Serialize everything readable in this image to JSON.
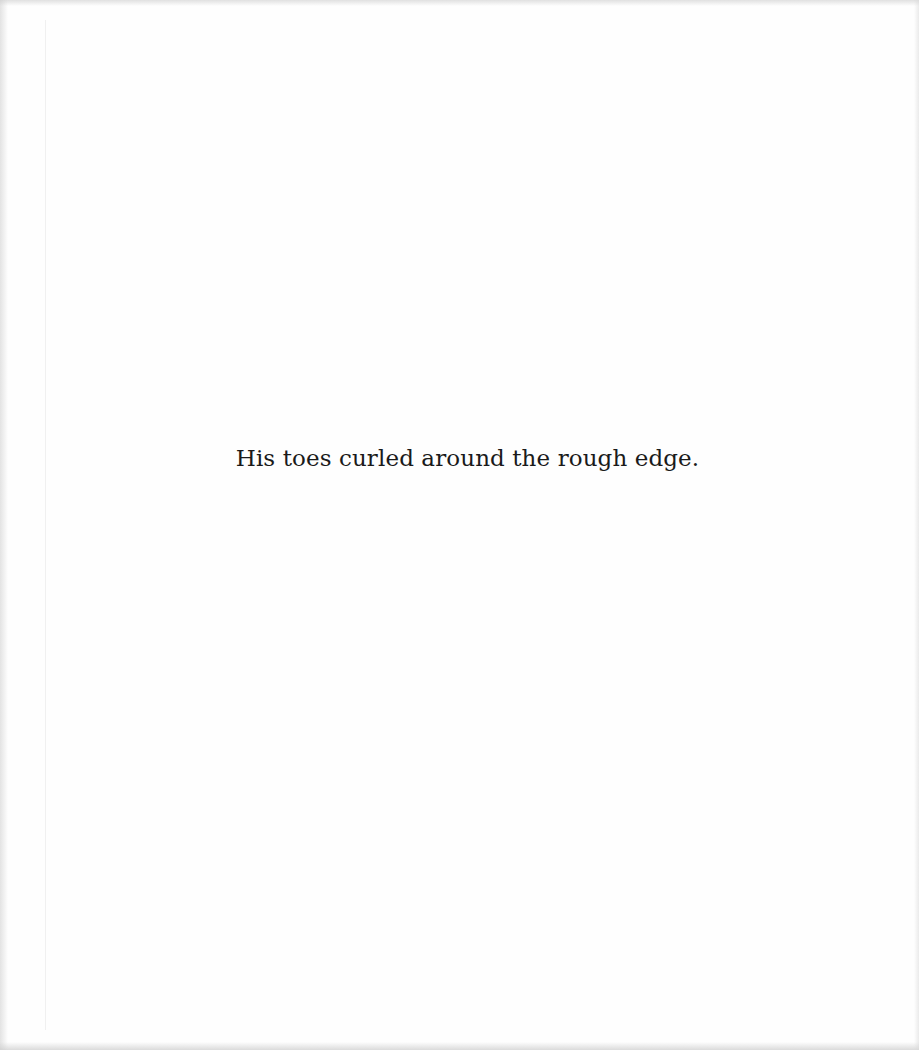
{
  "page": {
    "lines": [
      "His toes curled around the rough edge."
    ]
  }
}
